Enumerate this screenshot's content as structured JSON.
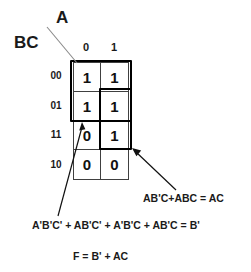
{
  "diagram": {
    "type": "karnaugh-map",
    "variable_labels": {
      "columns": "A",
      "rows": "BC"
    },
    "column_headers": [
      "0",
      "1"
    ],
    "row_headers": [
      "00",
      "01",
      "11",
      "10"
    ],
    "cells": [
      [
        "1",
        "1"
      ],
      [
        "1",
        "1"
      ],
      [
        "0",
        "1"
      ],
      [
        "0",
        "0"
      ]
    ],
    "groups": [
      {
        "name": "b-prime-group",
        "label": "A'B'C' + AB'C' + A'B'C + AB'C = B'",
        "covers_rows": [
          "00",
          "01"
        ],
        "covers_columns": [
          "0",
          "1"
        ]
      },
      {
        "name": "ac-group",
        "label": "AB'C+ABC = AC",
        "covers_rows": [
          "01",
          "11"
        ],
        "covers_columns": [
          "1"
        ]
      }
    ],
    "equations": {
      "ac": "AB'C+ABC = AC",
      "b_prime": "A'B'C' + AB'C' + A'B'C + AB'C = B'",
      "result": "F = B' + AC"
    },
    "colors": {
      "grid_line": "#404040",
      "group_outline": "#000000",
      "text": "#1a1a1a",
      "background": "#ffffff"
    }
  }
}
